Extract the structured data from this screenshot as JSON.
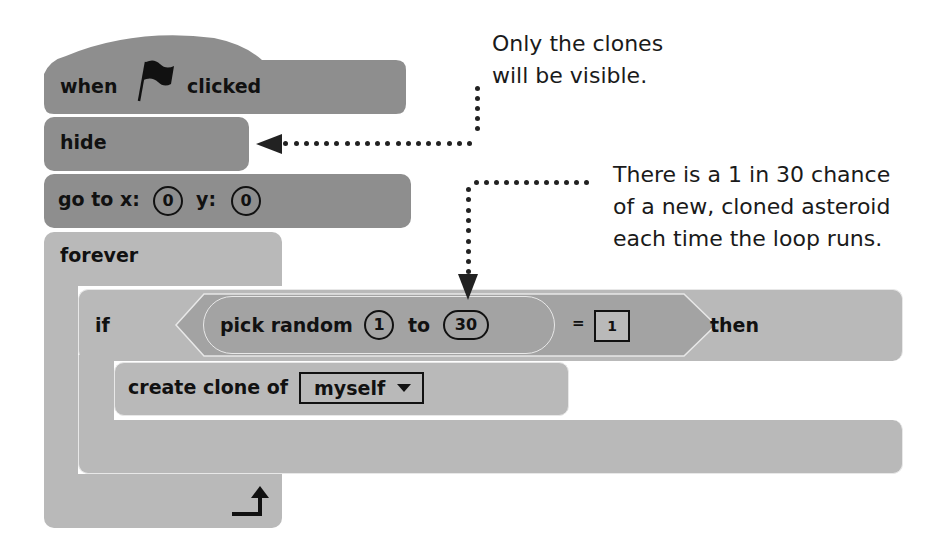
{
  "script": {
    "hat_block": {
      "when": "when",
      "icon": "green-flag-icon",
      "clicked": "clicked"
    },
    "hide_block": {
      "label": "hide"
    },
    "goto_block": {
      "label_x": "go to x:",
      "x_value": "0",
      "label_y": "y:",
      "y_value": "0"
    },
    "forever_block": {
      "label": "forever",
      "end_icon": "loop-arrow-icon"
    },
    "if_block": {
      "label_if": "if",
      "condition": {
        "pick_random_label": "pick random",
        "from_value": "1",
        "to_label": "to",
        "to_value": "30",
        "operator": "=",
        "compare_value": "1"
      },
      "label_then": "then"
    },
    "create_clone_block": {
      "label": "create clone of",
      "dropdown_value": "myself",
      "dropdown_icon": "dropdown-triangle-icon"
    }
  },
  "annotations": {
    "note1": {
      "line1": "Only the clones",
      "line2": "will be visible."
    },
    "note2": {
      "line1": "There is a 1 in 30 chance",
      "line2": "of a new, cloned asteroid",
      "line3": "each time the loop runs."
    }
  },
  "colors": {
    "dark_block": "#8e8e8e",
    "light_block": "#b9b9b9",
    "reporter": "#a3a3a3",
    "text": "#111111",
    "dots": "#222222"
  }
}
